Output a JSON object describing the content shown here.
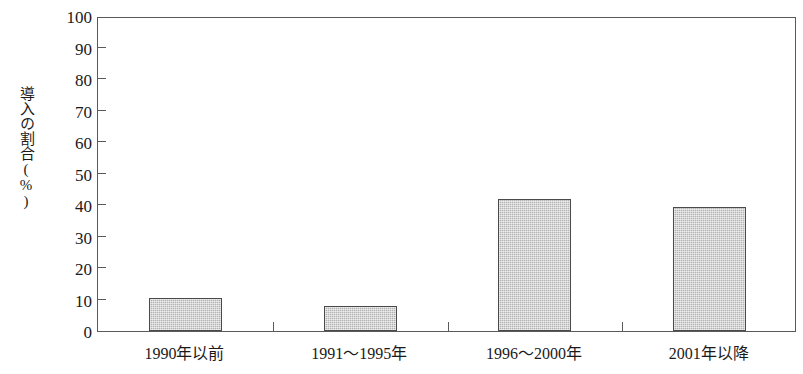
{
  "chart_data": {
    "type": "bar",
    "title": "",
    "xlabel": "",
    "ylabel": "導入の割合(%)",
    "categories": [
      "1990年以前",
      "1991〜1995年",
      "1996〜2000年",
      "2001年以降"
    ],
    "values": [
      10.5,
      8,
      42,
      39.5
    ],
    "ylim": [
      0,
      100
    ],
    "yticks": [
      0,
      10,
      20,
      30,
      40,
      50,
      60,
      70,
      80,
      90,
      100
    ],
    "ytick_labels": [
      "0",
      "10",
      "20",
      "30",
      "40",
      "50",
      "60",
      "70",
      "80",
      "90",
      "100"
    ],
    "grid": false,
    "legend": false,
    "bar_color": "#b2b2b2",
    "bar_edge_color": "#4a4a4a",
    "axis_color": "#5a5a5a",
    "background_color": "#ffffff"
  }
}
